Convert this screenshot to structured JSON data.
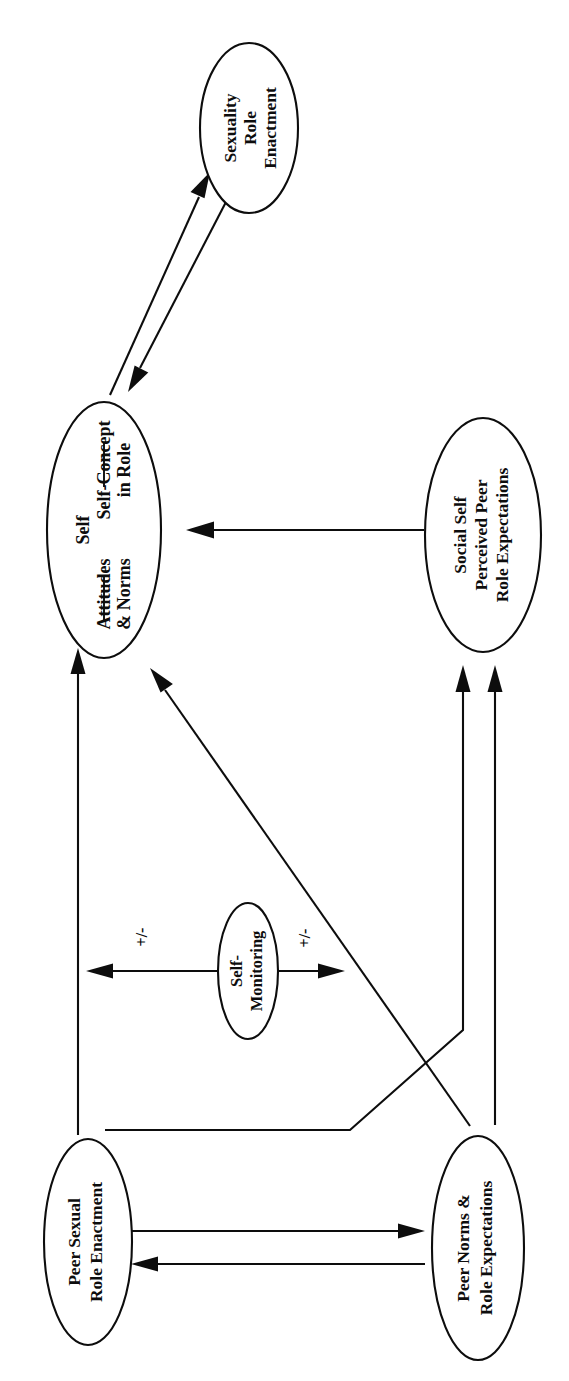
{
  "diagram": {
    "orientation": "rotated-90-ccw",
    "background_color": "#ffffff",
    "line_color": "#0d0d0d",
    "nodes": [
      {
        "id": "sexuality-role-enactment",
        "lines": [
          "Sexuality",
          "Role",
          "Enactment"
        ],
        "line1": "Sexuality",
        "line2": "Role",
        "line3": "Enactment"
      },
      {
        "id": "self",
        "heading": "Self",
        "left_group_line1": "Self-Concept",
        "left_group_line2": "in Role",
        "right_group_line1": "Attitudes",
        "right_group_line2": "& Norms"
      },
      {
        "id": "social-self",
        "line1": "Social Self",
        "line2": "Perceived Peer",
        "line3": "Role Expectations"
      },
      {
        "id": "self-monitoring",
        "line1": "Self-",
        "line2": "Monitoring"
      },
      {
        "id": "peer-sexual-role-enactment",
        "line1": "Peer Sexual",
        "line2": "Role Enactment"
      },
      {
        "id": "peer-norms-role-expectations",
        "line1": "Peer Norms &",
        "line2": "Role Expectations"
      }
    ],
    "edge_labels": {
      "moderator_positive_negative_upper": "+/-",
      "moderator_positive_negative_lower": "+/-"
    },
    "edges": [
      {
        "id": "self-to-sexuality",
        "from": "self",
        "to": "sexuality-role-enactment",
        "style": "double-parallel-arrows"
      },
      {
        "id": "sexuality-to-self",
        "from": "sexuality-role-enactment",
        "to": "self",
        "style": "double-parallel-arrows"
      },
      {
        "id": "social-self-to-self",
        "from": "social-self",
        "to": "self",
        "style": "single-arrow"
      },
      {
        "id": "peer-sexual-to-self",
        "from": "peer-sexual-role-enactment",
        "to": "self",
        "style": "single-arrow"
      },
      {
        "id": "peer-norms-to-self",
        "from": "peer-norms-role-expectations",
        "to": "self",
        "style": "single-arrow-diagonal"
      },
      {
        "id": "peer-sexual-to-social-self",
        "from": "peer-sexual-role-enactment",
        "to": "social-self",
        "style": "single-arrow-bent"
      },
      {
        "id": "peer-norms-to-social-self",
        "from": "peer-norms-role-expectations",
        "to": "social-self",
        "style": "single-arrow"
      },
      {
        "id": "peer-sexual-to-peer-norms",
        "from": "peer-sexual-role-enactment",
        "to": "peer-norms-role-expectations",
        "style": "single-arrow"
      },
      {
        "id": "peer-norms-to-peer-sexual",
        "from": "peer-norms-role-expectations",
        "to": "peer-sexual-role-enactment",
        "style": "single-arrow"
      },
      {
        "id": "self-monitoring-moderates-upper",
        "from": "self-monitoring",
        "to": "peer-sexual-to-self",
        "style": "moderator-arrow",
        "label": "+/-"
      },
      {
        "id": "self-monitoring-moderates-lower",
        "from": "self-monitoring",
        "to": "peer-norms-to-self",
        "style": "moderator-arrow",
        "label": "+/-"
      }
    ]
  }
}
